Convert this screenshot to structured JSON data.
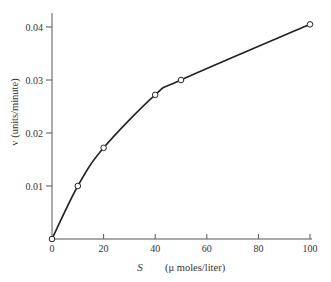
{
  "chart_data": {
    "type": "line",
    "title": "",
    "xlabel": "S",
    "xlabel_units": "(μ moles/liter)",
    "ylabel": "v (units/minute)",
    "xlim": [
      0,
      100
    ],
    "ylim": [
      0,
      0.04
    ],
    "x_ticks": [
      0,
      20,
      40,
      60,
      80,
      100
    ],
    "x_tick_labels": [
      "0",
      "20",
      "40",
      "60",
      "80",
      "100"
    ],
    "y_ticks": [
      0.01,
      0.02,
      0.03,
      0.04
    ],
    "y_tick_labels": [
      "0.01",
      "0.02",
      "0.03",
      "0.04"
    ],
    "grid": false,
    "legend": null,
    "series": [
      {
        "name": "v vs S",
        "marker": "open-circle",
        "line": "smooth-curve",
        "x": [
          0,
          10,
          20,
          40,
          50,
          100
        ],
        "y": [
          0.0,
          0.01,
          0.0172,
          0.0272,
          0.03,
          0.0405
        ]
      }
    ]
  },
  "colors": {
    "line": "#222222",
    "marker_fill": "#ffffff",
    "axis": "#555555"
  }
}
